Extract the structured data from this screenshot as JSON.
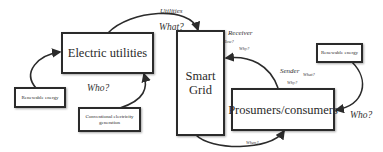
{
  "nodes": {
    "electric_utilities": "Electric utilities",
    "smart_grid": "Smart Grid",
    "prosumers": "Prosumers/consumers",
    "renewable_left": "Renewable energy",
    "conventional": "Conventional electricity generation",
    "renewable_right": "Renewable energy"
  },
  "labels": {
    "utilities": "Utilities",
    "what_top": "What?",
    "receiver": "Receiver",
    "how": "How?",
    "why_top": "Why?",
    "sender": "Sender",
    "what_sender": "What?",
    "why_sender": "Why?",
    "who_left": "Who?",
    "who_right": "Who?",
    "when": "When?"
  }
}
